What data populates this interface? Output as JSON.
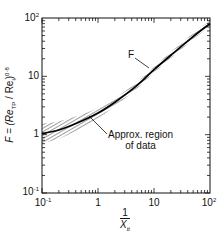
{
  "chart_data": {
    "type": "line",
    "title": "",
    "xlabel": "1 / X_tt",
    "ylabel": "F = (Re_TP / Re_l)^0.8",
    "xscale": "log",
    "yscale": "log",
    "xlim": [
      0.1,
      100
    ],
    "ylim": [
      0.1,
      100
    ],
    "grid": false,
    "legend": null,
    "x_ticks": [
      "10^-1",
      "1",
      "10",
      "10^2"
    ],
    "y_ticks": [
      "10^-1",
      "1",
      "10",
      "10^2"
    ],
    "series": [
      {
        "name": "F",
        "x": [
          0.1,
          0.2,
          0.5,
          1,
          2,
          5,
          10,
          20,
          50,
          100
        ],
        "values": [
          1.05,
          1.2,
          1.7,
          2.35,
          3.6,
          7,
          13,
          23,
          48,
          80
        ]
      },
      {
        "name": "Approx. region of data (upper bound)",
        "x": [
          0.1,
          0.2,
          0.5,
          1,
          2,
          5,
          10,
          20,
          50,
          100
        ],
        "values": [
          1.55,
          1.7,
          2.2,
          2.9,
          4.2,
          8.0,
          14.5,
          26,
          54,
          90
        ]
      },
      {
        "name": "Approx. region of data (lower bound)",
        "x": [
          0.1,
          0.2,
          0.5,
          1,
          2,
          5,
          10,
          20,
          50,
          100
        ],
        "values": [
          0.72,
          0.85,
          1.3,
          1.9,
          3.1,
          6.2,
          11.5,
          20.5,
          43,
          72
        ]
      }
    ],
    "annotations": [
      {
        "text": "F",
        "points_to": [
          10,
          13
        ]
      },
      {
        "text": "Approx. region of data",
        "points_to": [
          0.7,
          2.0
        ]
      }
    ]
  },
  "labels": {
    "x_ticks": [
      {
        "base": "10",
        "exp": "-1"
      },
      {
        "base": "1",
        "exp": ""
      },
      {
        "base": "10",
        "exp": ""
      },
      {
        "base": "10",
        "exp": "2"
      }
    ],
    "y_ticks": [
      {
        "base": "10",
        "exp": "2"
      },
      {
        "base": "10",
        "exp": ""
      },
      {
        "base": "1",
        "exp": ""
      },
      {
        "base": "10",
        "exp": "-1"
      }
    ],
    "ylabel_prefix": "F = (Re",
    "ylabel_sub1": "TP",
    "ylabel_mid": " / Re",
    "ylabel_sub2": "l",
    "ylabel_suffix": ")",
    "ylabel_exp": "0·8",
    "xlabel_num": "1",
    "xlabel_den": "X",
    "xlabel_den_sub": "tt",
    "annot_f": "F",
    "annot_region_line1": "Approx. region",
    "annot_region_line2": "of data"
  }
}
